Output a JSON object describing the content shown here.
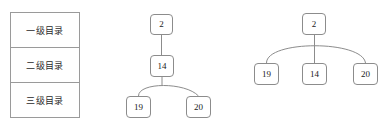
{
  "figure": {
    "background_color": "#ffffff",
    "line_color": "#8c8c8c",
    "text_color": "#1a1a1a"
  },
  "directory_table": {
    "rows": [
      {
        "label": "一级目录"
      },
      {
        "label": "二级目录"
      },
      {
        "label": "三级目录"
      }
    ]
  },
  "middle_tree": {
    "nodes": [
      {
        "id": "m-root",
        "label": "2",
        "x": 150,
        "y": 14,
        "w": 23,
        "h": 21
      },
      {
        "id": "m-mid",
        "label": "14",
        "x": 150,
        "y": 55,
        "w": 24,
        "h": 22
      },
      {
        "id": "m-left",
        "label": "19",
        "x": 126,
        "y": 96,
        "w": 25,
        "h": 22
      },
      {
        "id": "m-right",
        "label": "20",
        "x": 186,
        "y": 96,
        "w": 25,
        "h": 22
      }
    ],
    "edges": [
      {
        "from": "2",
        "to": "14",
        "style": "straight"
      },
      {
        "from": "14",
        "to": "19",
        "style": "arc"
      },
      {
        "from": "14",
        "to": "20",
        "style": "arc"
      }
    ]
  },
  "right_tree": {
    "nodes": [
      {
        "id": "r-root",
        "label": "2",
        "x": 302,
        "y": 13,
        "w": 24,
        "h": 22
      },
      {
        "id": "r-left",
        "label": "19",
        "x": 254,
        "y": 63,
        "w": 25,
        "h": 22
      },
      {
        "id": "r-mid",
        "label": "14",
        "x": 302,
        "y": 63,
        "w": 25,
        "h": 22
      },
      {
        "id": "r-right",
        "label": "20",
        "x": 353,
        "y": 63,
        "w": 25,
        "h": 22
      }
    ],
    "edges": [
      {
        "from": "2",
        "to": "19",
        "style": "arc"
      },
      {
        "from": "2",
        "to": "14",
        "style": "straight"
      },
      {
        "from": "2",
        "to": "20",
        "style": "arc"
      }
    ]
  }
}
